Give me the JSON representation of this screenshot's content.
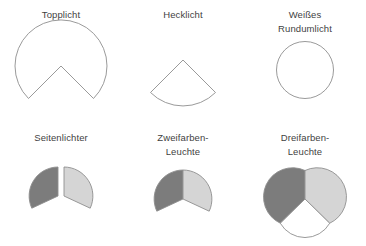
{
  "figure": {
    "title_text_color": "#3f3f3f",
    "background": "#ffffff",
    "stroke_color": "#8f8f8f",
    "fill_dark": "#7c7c7c",
    "fill_light": "#d5d5d5",
    "fill_white": "#ffffff",
    "columns": 3,
    "rows": 2
  },
  "cells": [
    {
      "id": "topplicht",
      "label": "Topplicht",
      "shape": "sector-dome-notched",
      "sectors": [
        {
          "name": "topplicht-outline",
          "fill": "#ffffff",
          "span_deg": 225
        }
      ]
    },
    {
      "id": "hecklicht",
      "label": "Hecklicht",
      "shape": "sector-wedge-down",
      "sectors": [
        {
          "name": "hecklicht-outline",
          "fill": "#ffffff",
          "span_deg": 135
        }
      ]
    },
    {
      "id": "weisses-rundumlicht",
      "label": "Weißes\nRundumlicht",
      "shape": "full-circle",
      "sectors": [
        {
          "name": "rundumlicht-circle",
          "fill": "#ffffff",
          "span_deg": 360
        }
      ]
    },
    {
      "id": "seitenlichter",
      "label": "Seitenlichter",
      "shape": "two-split-sectors",
      "sectors": [
        {
          "name": "seitenlicht-backbord",
          "fill": "#7c7c7c",
          "span_deg": 112.5
        },
        {
          "name": "seitenlicht-steuerbord",
          "fill": "#d5d5d5",
          "span_deg": 112.5
        }
      ]
    },
    {
      "id": "zweifarben-leuchte",
      "label": "Zweifarben-\nLeuchte",
      "shape": "sector-dome-notched-split",
      "sectors": [
        {
          "name": "zweifarben-links",
          "fill": "#7c7c7c",
          "span_deg": 112.5
        },
        {
          "name": "zweifarben-rechts",
          "fill": "#d5d5d5",
          "span_deg": 112.5
        }
      ]
    },
    {
      "id": "dreifarben-leuchte",
      "label": "Dreifarben-\nLeuchte",
      "shape": "circle-thirds",
      "sectors": [
        {
          "name": "dreifarben-links",
          "fill": "#7c7c7c",
          "span_deg": 120
        },
        {
          "name": "dreifarben-rechts",
          "fill": "#d5d5d5",
          "span_deg": 120
        },
        {
          "name": "dreifarben-heck",
          "fill": "#ffffff",
          "span_deg": 120
        }
      ]
    }
  ]
}
